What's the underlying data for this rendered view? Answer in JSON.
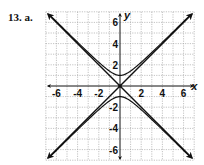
{
  "problem_label": "13. a.",
  "chart_data": {
    "type": "line",
    "title": "",
    "xlabel": "x",
    "ylabel": "y",
    "xlim": [
      -7,
      7
    ],
    "ylim": [
      -7,
      7
    ],
    "grid": true,
    "x_ticks": [
      -6,
      -4,
      -2,
      2,
      4,
      6
    ],
    "y_ticks": [
      6,
      4,
      2,
      -2,
      -4,
      -6
    ],
    "series": [
      {
        "name": "asymptote y = x",
        "equation": "y = x",
        "x": [
          -6.8,
          6.8
        ],
        "y": [
          -6.8,
          6.8
        ]
      },
      {
        "name": "asymptote y = -x",
        "equation": "y = -x",
        "x": [
          -6.8,
          6.8
        ],
        "y": [
          6.8,
          -6.8
        ]
      },
      {
        "name": "hyperbola upper branch",
        "equation": "y^2 - x^2 = 1",
        "branch": "upper",
        "x_range": [
          -6.5,
          6.5
        ]
      },
      {
        "name": "hyperbola lower branch",
        "equation": "y^2 - x^2 = 1",
        "branch": "lower",
        "x_range": [
          -6.5,
          6.5
        ]
      }
    ]
  }
}
